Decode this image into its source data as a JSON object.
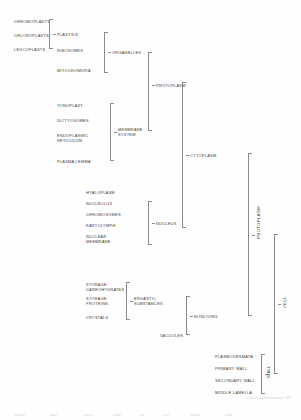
{
  "diagram": {
    "leaf_groups": {
      "plastid_types": [
        "CHROMOPLASTS",
        "CHLOROPLASTS",
        "LEUCOPLASTS"
      ],
      "organelle_members": [
        "PLASTIDS",
        "RIBOSOMES",
        "MITOCHONDRIA"
      ],
      "membrane_members": [
        "TONOPLAST",
        "DICTYOSOMES",
        "ENDOPLASMIC\nRETICULUM",
        "PLASMA LEMMA"
      ],
      "cytoplasm_extra": [
        "HYALOPLASM"
      ],
      "nucleus_members": [
        "NUCLEOLUS",
        "CHROMOSOMES",
        "KARYOLYMPH",
        "NUCLEAR\nMEMBRANE"
      ],
      "ergastic_members": [
        "STORAGE\nCARBOHYDRATES",
        "STORAGE\nPROTEINS",
        "CRYSTALS"
      ],
      "nonliving_extra": [
        "VACUOLES"
      ],
      "wall_members": [
        "PLASMODESMATA",
        "PRIMARY WALL",
        "SECONDARY WALL",
        "MIDDLE LAMELLA"
      ]
    },
    "nodes": {
      "plastids": "PLASTIDS",
      "organelles": "ORGANELLES",
      "membrane_system": "MEMBRANE\nSYSTEM",
      "protoplasm_mid": "PROTOPLASM",
      "nucleus": "NUCLEUS",
      "cytoplasm": "CYTOPLASM",
      "ergastic_substances": "ERGASTIC\nSUBSTANCES",
      "nonliving": "NONLIVING",
      "protoplasm_outer": "PROTOPLASM",
      "wall": "WALL",
      "cell": "CELL"
    },
    "colors": {
      "text": "#3b3b3b",
      "rule": "#8a8a8a",
      "background": "#fefefe"
    }
  }
}
